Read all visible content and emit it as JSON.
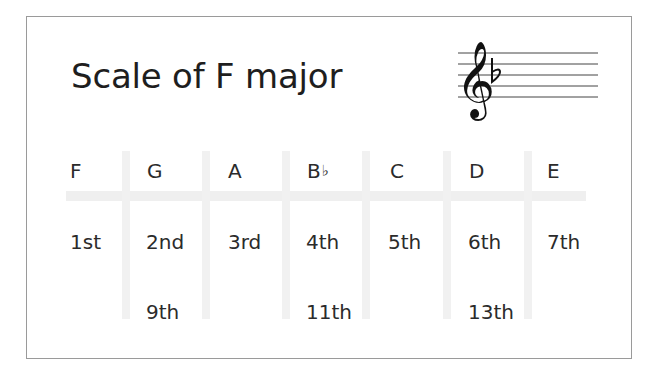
{
  "title": "Scale of F major",
  "key_signature": {
    "clef": "treble-clef",
    "accidentals": [
      "flat"
    ],
    "flat_symbol": "♭"
  },
  "notes": [
    {
      "name": "F",
      "accidental": "",
      "degrees": [
        "1st"
      ]
    },
    {
      "name": "G",
      "accidental": "",
      "degrees": [
        "2nd",
        "9th"
      ]
    },
    {
      "name": "A",
      "accidental": "",
      "degrees": [
        "3rd"
      ]
    },
    {
      "name": "B",
      "accidental": "♭",
      "degrees": [
        "4th",
        "11th"
      ]
    },
    {
      "name": "C",
      "accidental": "",
      "degrees": [
        "5th"
      ]
    },
    {
      "name": "D",
      "accidental": "",
      "degrees": [
        "6th",
        "13th"
      ]
    },
    {
      "name": "E",
      "accidental": "",
      "degrees": [
        "7th"
      ]
    }
  ],
  "colors": {
    "text": "#2b2b2b",
    "grid": "#efefef",
    "border": "#9a9a9a"
  }
}
